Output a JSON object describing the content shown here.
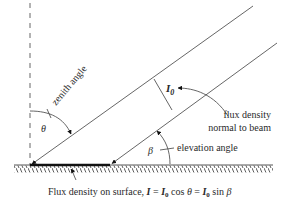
{
  "diagram": {
    "labels": {
      "zenith_angle": "zenith angle",
      "theta": "θ",
      "beta": "β",
      "I0_symbol": "I",
      "I0_subscript": "0",
      "flux_normal_line1": "flux density",
      "flux_normal_line2": "normal to beam",
      "elevation_angle": "elevation angle"
    },
    "caption": {
      "prefix": "Flux density on surface, ",
      "I": "I",
      "eq1": " = ",
      "I0a": "I",
      "sub0a": "0",
      "cos": " cos ",
      "theta": "θ",
      "eq2": " = ",
      "I0b": "I",
      "sub0b": "0",
      "sin": " sin ",
      "beta": "β"
    },
    "colors": {
      "line": "#555555",
      "text": "#2a2a2a",
      "background": "#ffffff"
    }
  }
}
